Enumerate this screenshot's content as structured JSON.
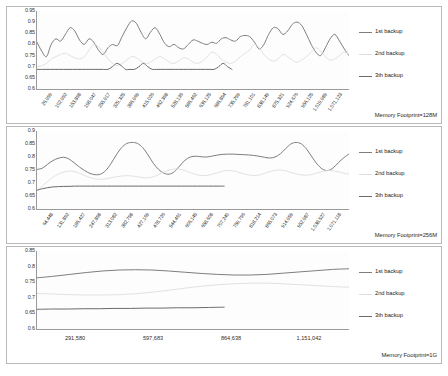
{
  "legend": {
    "series": [
      {
        "label": "1st backup",
        "color": "#7d7d7d"
      },
      {
        "label": "2nd backup",
        "color": "#dcdcdc"
      },
      {
        "label": "3th backup",
        "color": "#6b6b6b"
      }
    ]
  },
  "chart_data": [
    {
      "type": "line",
      "title": "",
      "annotation": "Memory Footprint=128M",
      "xlabel": "",
      "ylabel": "",
      "ylim": [
        0.6,
        0.95
      ],
      "yticks": [
        0.95,
        0.9,
        0.85,
        0.8,
        0.75,
        0.7,
        0.65,
        0.6
      ],
      "grid": true,
      "legend_position": "right",
      "categories": [
        "26,999",
        "102,992",
        "153,898",
        "198,047",
        "255,917",
        "329,325",
        "386,969",
        "415,026",
        "462,398",
        "528,136",
        "586,462",
        "636,125",
        "686,894",
        "735,299",
        "781,101",
        "838,149",
        "875,321",
        "924,676",
        "956,125",
        "1,019,989",
        "1,071,123"
      ],
      "series": [
        {
          "name": "1st backup",
          "color": "#7d7d7d",
          "values": [
            0.81,
            0.77,
            0.745,
            0.8,
            0.825,
            0.815,
            0.845,
            0.875,
            0.86,
            0.82,
            0.8,
            0.825,
            0.81,
            0.775,
            0.755,
            0.785,
            0.8,
            0.795,
            0.835,
            0.875,
            0.905,
            0.895,
            0.855,
            0.825,
            0.855,
            0.875,
            0.845,
            0.805,
            0.79,
            0.8,
            0.785,
            0.78,
            0.8,
            0.82,
            0.815,
            0.805,
            0.8,
            0.81,
            0.805,
            0.825,
            0.83,
            0.82,
            0.815,
            0.835,
            0.84,
            0.835,
            0.81,
            0.78,
            0.8,
            0.845,
            0.875,
            0.87,
            0.845,
            0.86,
            0.89,
            0.9,
            0.885,
            0.845,
            0.8,
            0.765,
            0.75,
            0.785,
            0.825,
            0.845,
            0.815,
            0.78,
            0.75
          ]
        },
        {
          "name": "2nd backup",
          "color": "#dcdcdc",
          "values": [
            0.7,
            0.705,
            0.715,
            0.735,
            0.745,
            0.755,
            0.76,
            0.75,
            0.74,
            0.735,
            0.745,
            0.775,
            0.8,
            0.79,
            0.765,
            0.735,
            0.715,
            0.705,
            0.715,
            0.73,
            0.745,
            0.74,
            0.725,
            0.715,
            0.72,
            0.735,
            0.745,
            0.735,
            0.72,
            0.715,
            0.725,
            0.74,
            0.735,
            0.72,
            0.715,
            0.725,
            0.745,
            0.765,
            0.755,
            0.735,
            0.72,
            0.715,
            0.725,
            0.745,
            0.76,
            0.775,
            0.8,
            0.785,
            0.755,
            0.735,
            0.725,
            0.735,
            0.755,
            0.745,
            0.73,
            0.72,
            0.73,
            0.745,
            0.765,
            0.785,
            0.77,
            0.745,
            0.73,
            0.735,
            0.75,
            0.765,
            0.755
          ]
        },
        {
          "name": "3th backup",
          "color": "#6b6b6b",
          "values": [
            0.688,
            0.688,
            0.688,
            0.688,
            0.688,
            0.688,
            0.688,
            0.688,
            0.688,
            0.688,
            0.688,
            0.688,
            0.688,
            0.688,
            0.688,
            0.688,
            0.688,
            0.7,
            0.715,
            0.705,
            0.688,
            0.688,
            0.688,
            0.7,
            0.715,
            0.7,
            0.688,
            0.688,
            0.688,
            0.688,
            0.688,
            0.688,
            0.688,
            0.688,
            0.688,
            0.688,
            0.688,
            0.688,
            0.688,
            0.688,
            0.688,
            0.7,
            0.715,
            0.7,
            0.688
          ],
          "partial": true,
          "coverage": 0.625
        }
      ]
    },
    {
      "type": "line",
      "title": "",
      "annotation": "Memory Footprint=256M",
      "xlabel": "",
      "ylabel": "",
      "ylim": [
        0.6,
        0.9
      ],
      "yticks": [
        0.9,
        0.85,
        0.8,
        0.75,
        0.7,
        0.65,
        0.6
      ],
      "grid": true,
      "legend_position": "right",
      "categories": [
        "64,448",
        "131,892",
        "186,427",
        "247,898",
        "313,082",
        "382,798",
        "427,169",
        "478,726",
        "544,461",
        "606,145",
        "658,608",
        "707,240",
        "759,796",
        "818,214",
        "865,073",
        "914,959",
        "952,987",
        "1,038,527",
        "1,071,118"
      ],
      "series": [
        {
          "name": "1st backup",
          "color": "#7d7d7d",
          "values": [
            0.752,
            0.757,
            0.772,
            0.786,
            0.795,
            0.799,
            0.793,
            0.778,
            0.762,
            0.748,
            0.737,
            0.732,
            0.734,
            0.748,
            0.775,
            0.808,
            0.836,
            0.852,
            0.856,
            0.852,
            0.836,
            0.808,
            0.776,
            0.752,
            0.738,
            0.734,
            0.744,
            0.766,
            0.788,
            0.8,
            0.803,
            0.801,
            0.8,
            0.803,
            0.807,
            0.81,
            0.811,
            0.811,
            0.81,
            0.809,
            0.808,
            0.806,
            0.803,
            0.799,
            0.796,
            0.8,
            0.812,
            0.832,
            0.85,
            0.856,
            0.85,
            0.83,
            0.8,
            0.772,
            0.753,
            0.748,
            0.758,
            0.778,
            0.797,
            0.812
          ]
        },
        {
          "name": "2nd backup",
          "color": "#dcdcdc",
          "values": [
            0.672,
            0.688,
            0.706,
            0.722,
            0.734,
            0.742,
            0.746,
            0.744,
            0.738,
            0.729,
            0.721,
            0.716,
            0.714,
            0.716,
            0.72,
            0.724,
            0.727,
            0.728,
            0.727,
            0.724,
            0.721,
            0.72,
            0.724,
            0.732,
            0.742,
            0.75,
            0.754,
            0.753,
            0.748,
            0.74,
            0.733,
            0.729,
            0.729,
            0.733,
            0.739,
            0.745,
            0.748,
            0.747,
            0.742,
            0.736,
            0.731,
            0.729,
            0.731,
            0.737,
            0.744,
            0.749,
            0.75,
            0.747,
            0.741,
            0.735,
            0.731,
            0.73,
            0.733,
            0.739,
            0.745,
            0.748,
            0.747,
            0.743,
            0.738,
            0.734
          ]
        },
        {
          "name": "3th backup",
          "color": "#6b6b6b",
          "values": [
            0.672,
            0.678,
            0.682,
            0.685,
            0.686,
            0.687,
            0.687,
            0.688,
            0.688,
            0.688,
            0.688,
            0.688,
            0.688,
            0.688,
            0.688,
            0.688,
            0.688,
            0.688,
            0.688,
            0.688,
            0.688,
            0.688,
            0.688,
            0.688,
            0.688,
            0.688,
            0.688,
            0.688,
            0.688,
            0.688,
            0.688,
            0.688,
            0.688,
            0.688,
            0.688,
            0.688
          ],
          "partial": true,
          "coverage": 0.6
        }
      ]
    },
    {
      "type": "line",
      "title": "",
      "annotation": "Memory Footprint=1G",
      "xlabel": "",
      "ylabel": "",
      "ylim": [
        0.6,
        0.85
      ],
      "yticks": [
        0.85,
        0.8,
        0.75,
        0.7,
        0.65,
        0.6
      ],
      "grid": true,
      "legend_position": "right",
      "categories": [
        "291,580",
        "597,683",
        "864,638",
        "1,151,042"
      ],
      "flat_labels": true,
      "series": [
        {
          "name": "1st backup",
          "color": "#7d7d7d",
          "values": [
            0.764,
            0.769,
            0.775,
            0.781,
            0.786,
            0.789,
            0.79,
            0.789,
            0.786,
            0.782,
            0.778,
            0.775,
            0.773,
            0.773,
            0.775,
            0.779,
            0.783,
            0.787,
            0.791,
            0.793
          ]
        },
        {
          "name": "2nd backup",
          "color": "#dcdcdc",
          "values": [
            0.714,
            0.712,
            0.71,
            0.709,
            0.709,
            0.71,
            0.713,
            0.718,
            0.724,
            0.731,
            0.737,
            0.742,
            0.745,
            0.747,
            0.747,
            0.745,
            0.742,
            0.739,
            0.736,
            0.734
          ]
        },
        {
          "name": "3th backup",
          "color": "#6b6b6b",
          "values": [
            0.663,
            0.664,
            0.664,
            0.665,
            0.665,
            0.666,
            0.666,
            0.667,
            0.667,
            0.668,
            0.668,
            0.669,
            0.67
          ],
          "partial": true,
          "coverage": 0.6
        }
      ]
    }
  ]
}
